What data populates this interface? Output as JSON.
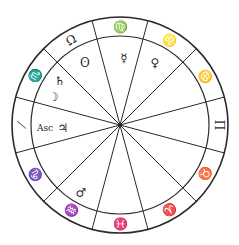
{
  "wheel": {
    "center": [
      120,
      125
    ],
    "outer_radius": 108,
    "inner_radius": 89,
    "stroke_color": "#2a2a2a",
    "boundary_offset_deg": 15
  },
  "signs": [
    {
      "name": "virgo",
      "glyph": "♍",
      "angle": 0
    },
    {
      "name": "leo",
      "glyph": "♌",
      "angle": 30
    },
    {
      "name": "cancer",
      "glyph": "♋",
      "angle": 60
    },
    {
      "name": "gemini",
      "glyph": "Π",
      "angle": 90
    },
    {
      "name": "taurus",
      "glyph": "♉",
      "angle": 120
    },
    {
      "name": "aries",
      "glyph": "♈",
      "angle": 150
    },
    {
      "name": "pisces",
      "glyph": "♓",
      "angle": 180
    },
    {
      "name": "aquarius",
      "glyph": "♒",
      "angle": 210
    },
    {
      "name": "capricorn",
      "glyph": "♑",
      "angle": 240
    },
    {
      "name": "sagittarius",
      "glyph": "⟋",
      "angle": 270
    },
    {
      "name": "scorpio",
      "glyph": "♏",
      "angle": 300
    },
    {
      "name": "libra",
      "glyph": "Ω",
      "angle": 330
    }
  ],
  "planets": [
    {
      "name": "mercury",
      "glyph": "☿",
      "x": 124,
      "y": 58
    },
    {
      "name": "venus",
      "glyph": "♀",
      "x": 155,
      "y": 63
    },
    {
      "name": "sun",
      "glyph": "ʘ",
      "x": 85,
      "y": 63
    },
    {
      "name": "saturn",
      "glyph": "♄",
      "x": 60,
      "y": 81
    },
    {
      "name": "moon",
      "glyph": "☽",
      "x": 53,
      "y": 97
    },
    {
      "name": "jupiter",
      "glyph": "♃",
      "x": 63,
      "y": 128
    },
    {
      "name": "mars",
      "glyph": "♂",
      "x": 81,
      "y": 193
    }
  ],
  "labels": [
    {
      "name": "ascendant-label",
      "text": "Asc",
      "x": 45,
      "y": 128
    }
  ]
}
